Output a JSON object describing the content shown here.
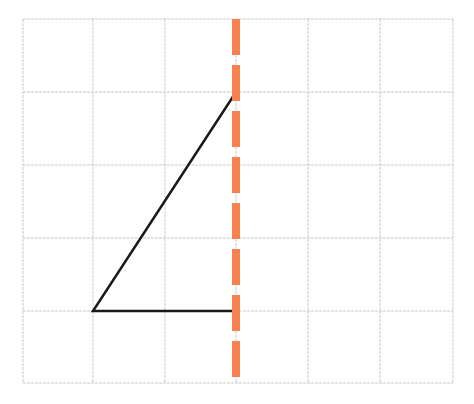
{
  "diagram": {
    "title": "",
    "grid": {
      "x_lines": [
        23,
        93,
        165,
        236,
        308,
        380,
        453
      ],
      "y_lines": [
        19,
        92,
        165,
        238,
        311,
        383
      ],
      "columns": 6,
      "rows": 5,
      "color": "#c8c8c8"
    },
    "triangle": {
      "vertices": [
        [
          93,
          311
        ],
        [
          236,
          92
        ],
        [
          236,
          311
        ]
      ],
      "grid_vertices": [
        [
          1,
          4
        ],
        [
          3,
          1
        ],
        [
          3,
          4
        ]
      ],
      "color": "#1a1a1a",
      "open_edge": "vertical side lies on mirror line"
    },
    "mirror_line": {
      "orientation": "vertical",
      "x": 236,
      "y_start": 19,
      "y_end": 383,
      "dash_length": 36,
      "gap_length": 10,
      "stroke_width": 8,
      "color": "#F7824F"
    }
  }
}
